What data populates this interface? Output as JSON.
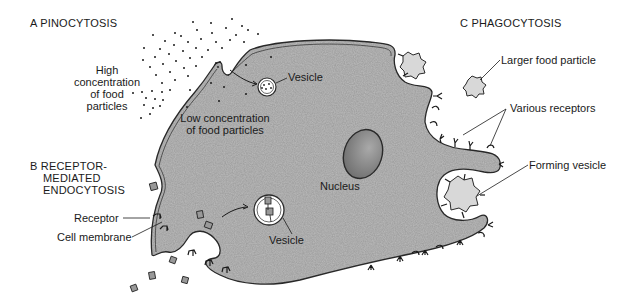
{
  "colors": {
    "cytoplasm": "#b9b9b9",
    "membrane": "#2a2a2a",
    "nucleus": "#8f8f8f",
    "background": "#ffffff",
    "particle": "#cfcfcf",
    "text": "#1a1a1a"
  },
  "sections": {
    "a": {
      "heading": "A  PINOCYTOSIS",
      "high_conc": [
        "High",
        "concentration",
        "of food",
        "particles"
      ],
      "low_conc": [
        "Low concentration",
        "of food particles"
      ],
      "vesicle": "Vesicle"
    },
    "b": {
      "heading": [
        "B  RECEPTOR-",
        "MEDIATED",
        "ENDOCYTOSIS"
      ],
      "receptor": "Receptor",
      "cell_membrane": "Cell membrane",
      "vesicle": "Vesicle"
    },
    "c": {
      "heading": "C  PHAGOCYTOSIS",
      "larger_particle": "Larger food particle",
      "various_receptors": "Various receptors",
      "forming_vesicle": "Forming vesicle"
    },
    "nucleus": "Nucleus"
  }
}
